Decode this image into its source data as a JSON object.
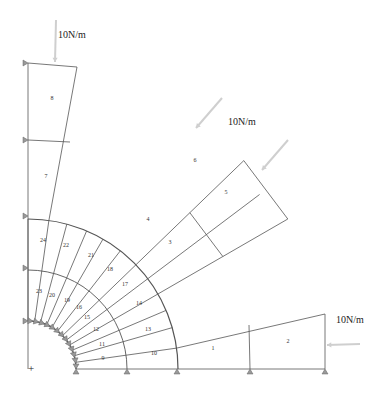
{
  "diagram": {
    "type": "finite-element-mesh",
    "center": {
      "x": 28,
      "y": 369
    },
    "radii": {
      "inner": 48,
      "middle": 99,
      "outer": 150
    },
    "colors": {
      "mesh_line": "#555555",
      "load_arrow": "#c8c8c8",
      "support": "#888888",
      "label": "#333333"
    },
    "element_labels": [
      {
        "id": "1",
        "x": 213,
        "y": 349
      },
      {
        "id": "2",
        "x": 288,
        "y": 342
      },
      {
        "id": "3",
        "x": 170,
        "y": 243
      },
      {
        "id": "4",
        "x": 148,
        "y": 220
      },
      {
        "id": "5",
        "x": 226,
        "y": 193
      },
      {
        "id": "6",
        "x": 195,
        "y": 161
      },
      {
        "id": "7",
        "x": 46,
        "y": 177
      },
      {
        "id": "8",
        "x": 52,
        "y": 99
      },
      {
        "id": "9",
        "x": 103,
        "y": 359
      },
      {
        "id": "10",
        "x": 154,
        "y": 354
      },
      {
        "id": "11",
        "x": 102,
        "y": 345
      },
      {
        "id": "12",
        "x": 96,
        "y": 330
      },
      {
        "id": "13",
        "x": 148,
        "y": 330
      },
      {
        "id": "14",
        "x": 139,
        "y": 304
      },
      {
        "id": "15",
        "x": 87,
        "y": 318
      },
      {
        "id": "16",
        "x": 79,
        "y": 308
      },
      {
        "id": "17",
        "x": 125,
        "y": 285
      },
      {
        "id": "18",
        "x": 110,
        "y": 270
      },
      {
        "id": "19",
        "x": 67,
        "y": 301
      },
      {
        "id": "20",
        "x": 52,
        "y": 296
      },
      {
        "id": "21",
        "x": 91,
        "y": 256
      },
      {
        "id": "22",
        "x": 66,
        "y": 246
      },
      {
        "id": "23",
        "x": 39,
        "y": 292
      },
      {
        "id": "24",
        "x": 43,
        "y": 241
      }
    ],
    "loads": [
      {
        "label": "10N/m",
        "label_x": 58,
        "label_y": 36
      },
      {
        "label": "10N/m",
        "label_x": 228,
        "label_y": 123
      },
      {
        "label": "10N/m",
        "label_x": 336,
        "label_y": 321
      }
    ],
    "origin_marker": {
      "symbol": "+",
      "x": 31,
      "y": 369
    }
  }
}
